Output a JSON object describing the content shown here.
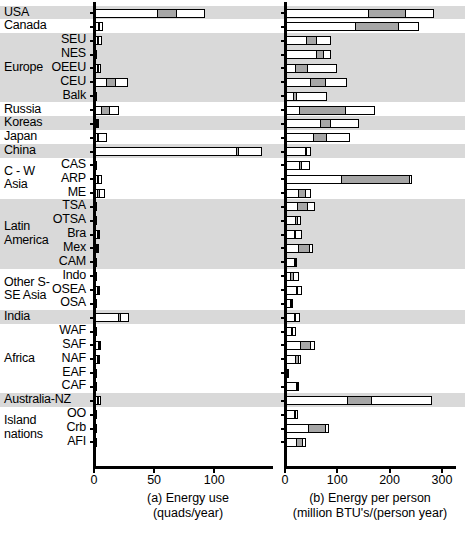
{
  "chart_data": {
    "type": "bar",
    "orientation": "horizontal",
    "grid": false,
    "legend": null,
    "panels": [
      {
        "id": "a",
        "title": "(a) Energy use",
        "subtitle": "(quads/year)",
        "xlabel": "(a) Energy use (quads/year)",
        "ylabel": "",
        "xlim": [
          0,
          148
        ],
        "xticks": [
          0,
          50,
          100
        ],
        "xticklabels": [
          "0",
          "50",
          "100"
        ]
      },
      {
        "id": "b",
        "title": "(b) Energy per person",
        "subtitle": "(million BTU's/(person year)",
        "xlabel": "(b) Energy per person (million BTU's/(person year)",
        "ylabel": "",
        "xlim": [
          0,
          325
        ],
        "xticks": [
          0,
          100,
          200,
          300
        ],
        "xticklabels": [
          "0",
          "100",
          "200",
          "300"
        ]
      }
    ],
    "stack_segments": [
      "white-1",
      "gray",
      "white-2"
    ],
    "categories": [
      "USA",
      "Canada",
      "SEU",
      "NES",
      "OEEU",
      "CEU",
      "Balk",
      "Russia",
      "Koreas",
      "Japan",
      "China",
      "CAS",
      "ARP",
      "ME",
      "TSA",
      "OTSA",
      "Bra",
      "Mex",
      "CAM",
      "Indo",
      "OSEA",
      "OSA",
      "India",
      "WAF",
      "SAF",
      "NAF",
      "EAF",
      "CAF",
      "Australia-NZ",
      "OO",
      "Crb",
      "AFI"
    ],
    "rows": [
      {
        "label": "USA",
        "group": "USA",
        "a": [
          52.5,
          17.0,
          22.5
        ],
        "b": [
          158,
          75,
          52
        ]
      },
      {
        "label": "Canada",
        "group": "Canada",
        "a": [
          2.8,
          1.3,
          3.1
        ],
        "b": [
          133,
          87,
          37
        ]
      },
      {
        "label": "SEU",
        "group": "Europe",
        "a": [
          2.5,
          1.6,
          2.4
        ],
        "b": [
          40,
          22,
          26
        ]
      },
      {
        "label": "NES",
        "group": "Europe",
        "a": [
          0.9,
          0.2,
          0.2
        ],
        "b": [
          61,
          15,
          11
        ]
      },
      {
        "label": "OEEU",
        "group": "Europe",
        "a": [
          2.6,
          1.6,
          1.5
        ],
        "b": [
          18,
          26,
          55
        ]
      },
      {
        "label": "CEU",
        "group": "Europe",
        "a": [
          10.1,
          8.5,
          9.8
        ],
        "b": [
          48,
          31,
          40
        ]
      },
      {
        "label": "Balk",
        "group": "Europe",
        "a": [
          0.5,
          0.2,
          0.3
        ],
        "b": [
          14,
          9,
          57
        ]
      },
      {
        "label": "Russia",
        "group": "Russia",
        "a": [
          5.0,
          8.6,
          7.2
        ],
        "b": [
          25,
          93,
          54
        ]
      },
      {
        "label": "Koreas",
        "group": "Koreas",
        "a": [
          1.5,
          0.9,
          1.7
        ],
        "b": [
          67,
          21,
          53
        ]
      },
      {
        "label": "Japan",
        "group": "Japan",
        "a": [
          2.2,
          1.9,
          6.4
        ],
        "b": [
          53,
          27,
          45
        ]
      },
      {
        "label": "China",
        "group": "China",
        "a": [
          119.0,
          2.5,
          18.0
        ],
        "b": [
          40,
          3,
          7
        ]
      },
      {
        "label": "CAS",
        "group": "C - W Asia",
        "a": [
          0.9,
          0.4,
          0.6
        ],
        "b": [
          26,
          8,
          14
        ]
      },
      {
        "label": "ARP",
        "group": "C - W Asia",
        "a": [
          2.1,
          2.2,
          2.5
        ],
        "b": [
          107,
          133,
          2
        ]
      },
      {
        "label": "ME",
        "group": "C - W Asia",
        "a": [
          2.2,
          3.0,
          3.9
        ],
        "b": [
          24,
          18,
          8
        ]
      },
      {
        "label": "TSA",
        "group": "Latin America",
        "a": [
          0.6,
          0.2,
          0.3
        ],
        "b": [
          23,
          22,
          13
        ]
      },
      {
        "label": "OTSA",
        "group": "Latin America",
        "a": [
          0.3,
          0.1,
          0.2
        ],
        "b": [
          20,
          6,
          4
        ]
      },
      {
        "label": "Bra",
        "group": "Latin America",
        "a": [
          2.1,
          0.5,
          2.2
        ],
        "b": [
          17,
          3,
          12
        ]
      },
      {
        "label": "Mex",
        "group": "Latin America",
        "a": [
          1.6,
          0.6,
          1.8
        ],
        "b": [
          24,
          25,
          4
        ]
      },
      {
        "label": "CAM",
        "group": "Latin America",
        "a": [
          0.4,
          0.1,
          0.2
        ],
        "b": [
          19,
          2,
          2
        ]
      },
      {
        "label": "Indo",
        "group": "Other S- SE Asia",
        "a": [
          1.1,
          0.4,
          0.9
        ],
        "b": [
          10,
          9,
          8
        ]
      },
      {
        "label": "OSEA",
        "group": "Other S- SE Asia",
        "a": [
          1.9,
          0.8,
          2.5
        ],
        "b": [
          21,
          5,
          7
        ]
      },
      {
        "label": "OSA",
        "group": "Other S- SE Asia",
        "a": [
          0.6,
          0.2,
          0.3
        ],
        "b": [
          9,
          4,
          3
        ]
      },
      {
        "label": "India",
        "group": "India",
        "a": [
          20.5,
          2.6,
          5.9
        ],
        "b": [
          18,
          4,
          6
        ]
      },
      {
        "label": "WAF",
        "group": "Africa",
        "a": [
          0.5,
          0.2,
          0.3
        ],
        "b": [
          11,
          5,
          4
        ]
      },
      {
        "label": "SAF",
        "group": "Africa",
        "a": [
          3.9,
          1.6,
          0.6
        ],
        "b": [
          29,
          22,
          6
        ]
      },
      {
        "label": "NAF",
        "group": "Africa",
        "a": [
          2.0,
          1.1,
          1.9
        ],
        "b": [
          19,
          9,
          3
        ]
      },
      {
        "label": "EAF",
        "group": "Africa",
        "a": [
          0.3,
          0.1,
          0.1
        ],
        "b": [
          5,
          2,
          1
        ]
      },
      {
        "label": "CAF",
        "group": "Africa",
        "a": [
          0.2,
          0.1,
          0.1
        ],
        "b": [
          22,
          3,
          2
        ]
      },
      {
        "label": "Australia-NZ",
        "group": "Australia-NZ",
        "a": [
          2.6,
          1.3,
          1.8
        ],
        "b": [
          119,
          48,
          113
        ]
      },
      {
        "label": "OO",
        "group": "Island nations",
        "a": [
          0.3,
          0.1,
          0.1
        ],
        "b": [
          18,
          4,
          3
        ]
      },
      {
        "label": "Crb",
        "group": "Island nations",
        "a": [
          0.8,
          0.3,
          0.4
        ],
        "b": [
          45,
          36,
          3
        ]
      },
      {
        "label": "AFI",
        "group": "Island nations",
        "a": [
          0.3,
          0.1,
          0.1
        ],
        "b": [
          22,
          13,
          6
        ]
      }
    ],
    "groups": [
      {
        "name": "USA",
        "rows": [
          "USA"
        ],
        "shaded": true
      },
      {
        "name": "Canada",
        "rows": [
          "Canada"
        ],
        "shaded": false
      },
      {
        "name": "Europe",
        "rows": [
          "SEU",
          "NES",
          "OEEU",
          "CEU",
          "Balk"
        ],
        "shaded": true
      },
      {
        "name": "Russia",
        "rows": [
          "Russia"
        ],
        "shaded": false
      },
      {
        "name": "Koreas",
        "rows": [
          "Koreas"
        ],
        "shaded": true
      },
      {
        "name": "Japan",
        "rows": [
          "Japan"
        ],
        "shaded": false
      },
      {
        "name": "China",
        "rows": [
          "China"
        ],
        "shaded": true
      },
      {
        "name": "C - W Asia",
        "rows": [
          "CAS",
          "ARP",
          "ME"
        ],
        "shaded": false
      },
      {
        "name": "Latin America",
        "rows": [
          "TSA",
          "OTSA",
          "Bra",
          "Mex",
          "CAM"
        ],
        "shaded": true
      },
      {
        "name": "Other S- SE Asia",
        "rows": [
          "Indo",
          "OSEA",
          "OSA"
        ],
        "shaded": false
      },
      {
        "name": "India",
        "rows": [
          "India"
        ],
        "shaded": true
      },
      {
        "name": "Africa",
        "rows": [
          "WAF",
          "SAF",
          "NAF",
          "EAF",
          "CAF"
        ],
        "shaded": false
      },
      {
        "name": "Australia-NZ",
        "rows": [
          "Australia-NZ"
        ],
        "shaded": true
      },
      {
        "name": "Island nations",
        "rows": [
          "OO",
          "Crb",
          "AFI"
        ],
        "shaded": false
      }
    ],
    "colors": {
      "segment_white": "#ffffff",
      "segment_gray": "#a6a6a6",
      "outline": "#000000",
      "band_shaded": "#d9d9d9",
      "background": "#ffffff"
    }
  },
  "group_labels": [
    {
      "text": "USA"
    },
    {
      "text": "Canada"
    },
    {
      "text": "Europe"
    },
    {
      "text": "Russia"
    },
    {
      "text": "Koreas"
    },
    {
      "text": "Japan"
    },
    {
      "text": "China"
    },
    {
      "text": "C - W"
    },
    {
      "text": "Asia"
    },
    {
      "text": "Latin"
    },
    {
      "text": "America"
    },
    {
      "text": "Other S-"
    },
    {
      "text": "SE Asia"
    },
    {
      "text": "India"
    },
    {
      "text": "Africa"
    },
    {
      "text": "Australia-NZ"
    },
    {
      "text": "Island"
    },
    {
      "text": "nations"
    }
  ],
  "sub_labels": [
    "SEU",
    "NES",
    "OEEU",
    "CEU",
    "Balk",
    "CAS",
    "ARP",
    "ME",
    "TSA",
    "OTSA",
    "Bra",
    "Mex",
    "CAM",
    "Indo",
    "OSEA",
    "OSA",
    "WAF",
    "SAF",
    "NAF",
    "EAF",
    "CAF",
    "OO",
    "Crb",
    "AFI"
  ]
}
